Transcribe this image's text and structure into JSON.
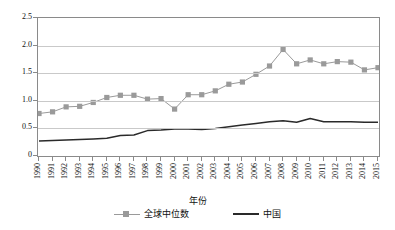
{
  "chart_data": {
    "type": "line",
    "title": "",
    "xlabel": "年份",
    "ylabel": "",
    "grid": true,
    "legend_position": "bottom",
    "xlim": [
      1990,
      2015
    ],
    "ylim": [
      0,
      2.5
    ],
    "yticks": [
      "0",
      "0.5",
      "1.0",
      "1.5",
      "2.0",
      "2.5"
    ],
    "ytick_values": [
      0,
      0.5,
      1.0,
      1.5,
      2.0,
      2.5
    ],
    "categories": [
      "1990",
      "1991",
      "1992",
      "1993",
      "1994",
      "1995",
      "1996",
      "1997",
      "1998",
      "1999",
      "2000",
      "2001",
      "2002",
      "2003",
      "2004",
      "2005",
      "2006",
      "2007",
      "2008",
      "2009",
      "2010",
      "2011",
      "2012",
      "2013",
      "2014",
      "2015"
    ],
    "series": [
      {
        "name": "全球中位数",
        "color": "#9a9a9a",
        "marker": "square",
        "values": [
          0.77,
          0.8,
          0.89,
          0.9,
          0.97,
          1.06,
          1.1,
          1.1,
          1.03,
          1.04,
          0.85,
          1.11,
          1.11,
          1.18,
          1.3,
          1.34,
          1.48,
          1.63,
          1.93,
          1.67,
          1.74,
          1.67,
          1.71,
          1.7,
          1.56,
          1.6
        ]
      },
      {
        "name": "中国",
        "color": "#2a2a2a",
        "marker": "none",
        "values": [
          0.27,
          0.28,
          0.29,
          0.3,
          0.31,
          0.32,
          0.37,
          0.38,
          0.46,
          0.47,
          0.49,
          0.49,
          0.48,
          0.5,
          0.53,
          0.56,
          0.59,
          0.62,
          0.64,
          0.61,
          0.68,
          0.62,
          0.62,
          0.62,
          0.61,
          0.61
        ]
      }
    ]
  },
  "legend": {
    "items": [
      {
        "label": "全球中位数"
      },
      {
        "label": "中国"
      }
    ]
  },
  "axis": {
    "x_title": "年份"
  },
  "colors": {
    "global_median": "#9a9a9a",
    "china": "#2a2a2a",
    "grid": "#c9c9c9",
    "frame": "#8a8a8a"
  }
}
